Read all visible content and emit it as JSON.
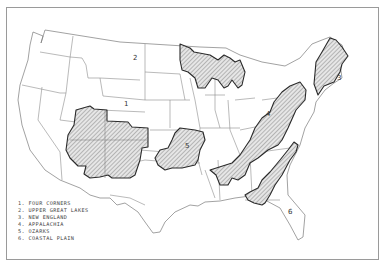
{
  "map": {
    "title": "",
    "frame": {
      "border_color": "#9a9a9a"
    },
    "colors": {
      "region_outline": "#2a2a2a",
      "state_lines": "#8c8c8c",
      "hatch": "#555555",
      "region_fill": "#e6e6e6"
    },
    "region_labels": [
      {
        "id": 1,
        "text": "1",
        "name": "Four Corners"
      },
      {
        "id": 2,
        "text": "2",
        "name": "Upper Great Lakes"
      },
      {
        "id": 3,
        "text": "3",
        "name": "New England"
      },
      {
        "id": 4,
        "text": "4",
        "name": "Appalachia"
      },
      {
        "id": 5,
        "text": "5",
        "name": "Ozarks"
      },
      {
        "id": 6,
        "text": "6",
        "name": "Coastal Plain"
      }
    ],
    "legend": [
      {
        "text": "1. FOUR CORNERS"
      },
      {
        "text": "2. UPPER GREAT LAKES"
      },
      {
        "text": "3. NEW ENGLAND"
      },
      {
        "text": "4. APPALACHIA"
      },
      {
        "text": "5. OZARKS"
      },
      {
        "text": "6. COASTAL PLAIN"
      }
    ]
  }
}
